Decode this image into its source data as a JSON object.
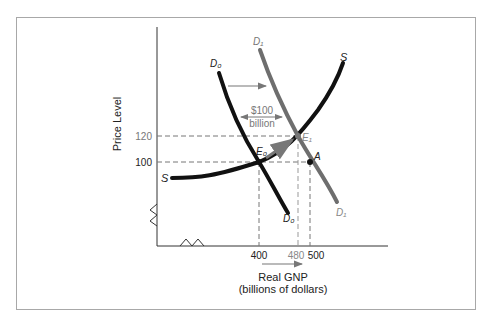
{
  "diagram": {
    "y_axis_label": "Price Level",
    "x_axis_label": "Real GNP",
    "x_axis_sublabel": "(billions of dollars)",
    "y_ticks": [
      "120",
      "100"
    ],
    "x_ticks": [
      "400",
      "480",
      "500"
    ],
    "shift_label_line1": "$100",
    "shift_label_line2": "billion",
    "curves": {
      "supply": "S",
      "supply_left": "S",
      "demand_initial": "D₀",
      "demand_initial_bottom": "D₀",
      "demand_new": "D₁",
      "demand_new_bottom": "D₁"
    },
    "points": {
      "e0": "E₀",
      "e1": "E₁",
      "a": "A"
    },
    "colors": {
      "curve_black": "#111111",
      "curve_gray": "#6e6e6e",
      "dashed": "#777777",
      "label_gray": "#8a8a8a"
    }
  }
}
